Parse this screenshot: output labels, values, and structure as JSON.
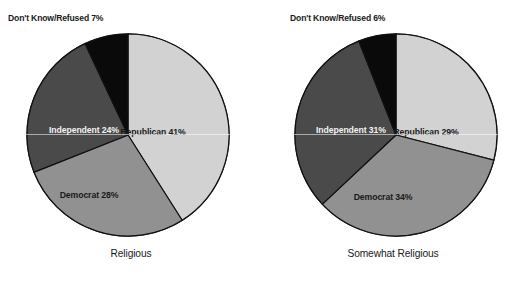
{
  "figure": {
    "background": "#ffffff",
    "panels": [
      {
        "id": "religious",
        "caption": "Religious",
        "callout": "Don't Know/Refused 7%",
        "slices": [
          {
            "key": "republican",
            "label": "Republican  41%",
            "value": 41,
            "color": "#d2d2d2",
            "text_color": "#1a1a1a",
            "label_x": 128,
            "label_y": 103
          },
          {
            "key": "democrat",
            "label": "Democrat 28%",
            "value": 28,
            "color": "#919191",
            "text_color": "#1a1a1a",
            "label_x": 64,
            "label_y": 166
          },
          {
            "key": "independent",
            "label": "Independent 24%",
            "value": 24,
            "color": "#4a4a4a",
            "text_color": "#f2f2f2",
            "label_x": 59,
            "label_y": 101
          },
          {
            "key": "dont_know",
            "label": "Don't Know/Refused 7%",
            "value": 7,
            "color": "#0a0a0a",
            "text_color": "#f2f2f2",
            "label_x": null,
            "label_y": null
          }
        ]
      },
      {
        "id": "somewhat-religious",
        "caption": "Somewhat Religious",
        "callout": "Don't Know/Refused 6%",
        "slices": [
          {
            "key": "republican",
            "label": "Republican  29%",
            "value": 29,
            "color": "#d2d2d2",
            "text_color": "#1a1a1a",
            "label_x": 133,
            "label_y": 103
          },
          {
            "key": "democrat",
            "label": "Democrat 34%",
            "value": 34,
            "color": "#919191",
            "text_color": "#1a1a1a",
            "label_x": 90,
            "label_y": 168
          },
          {
            "key": "independent",
            "label": "Independent 31%",
            "value": 31,
            "color": "#4a4a4a",
            "text_color": "#f2f2f2",
            "label_x": 58,
            "label_y": 101
          },
          {
            "key": "dont_know",
            "label": "Don't Know/Refused 6%",
            "value": 6,
            "color": "#0a0a0a",
            "text_color": "#f2f2f2",
            "label_x": null,
            "label_y": null
          }
        ]
      }
    ]
  },
  "chart_data": [
    {
      "type": "pie",
      "title": "Religious",
      "labels": [
        "Republican",
        "Democrat",
        "Independent",
        "Don't Know/Refused"
      ],
      "values": [
        41,
        28,
        24,
        7
      ],
      "value_labels": [
        "Republican  41%",
        "Democrat 28%",
        "Independent 24%",
        "Don't Know/Refused 7%"
      ],
      "colors": [
        "#d2d2d2",
        "#919191",
        "#4a4a4a",
        "#0a0a0a"
      ],
      "units": "percent",
      "start_angle_deg": 0,
      "direction": "clockwise",
      "legend": "none",
      "grid": false,
      "annotations": [
        "Don't Know/Refused 7%"
      ]
    },
    {
      "type": "pie",
      "title": "Somewhat Religious",
      "labels": [
        "Republican",
        "Democrat",
        "Independent",
        "Don't Know/Refused"
      ],
      "values": [
        29,
        34,
        31,
        6
      ],
      "value_labels": [
        "Republican  29%",
        "Democrat 34%",
        "Independent 31%",
        "Don't Know/Refused 6%"
      ],
      "colors": [
        "#d2d2d2",
        "#919191",
        "#4a4a4a",
        "#0a0a0a"
      ],
      "units": "percent",
      "start_angle_deg": 0,
      "direction": "clockwise",
      "legend": "none",
      "grid": false,
      "annotations": [
        "Don't Know/Refused 6%"
      ]
    }
  ]
}
